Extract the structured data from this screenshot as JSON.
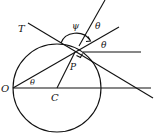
{
  "diagram": {
    "type": "geometry",
    "colors": {
      "stroke": "#111111",
      "background": "#ffffff"
    },
    "labels": {
      "T": "T",
      "psi": "ψ",
      "theta_top": "θ",
      "theta_right": "θ",
      "P": "P",
      "O": "O",
      "C": "C",
      "theta_origin": "θ"
    },
    "points": {
      "O": [
        13,
        88
      ],
      "C": [
        57,
        88
      ],
      "P": [
        75,
        52
      ]
    },
    "circle": {
      "center": "C",
      "radius": 44
    }
  }
}
